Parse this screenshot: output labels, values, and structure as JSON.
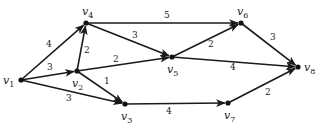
{
  "diagram": {
    "type": "weighted-directed-graph",
    "nodes": [
      {
        "id": "v1",
        "label": "v",
        "sub": "1",
        "x": 21,
        "y": 80,
        "lx": 3,
        "ly": 84
      },
      {
        "id": "v2",
        "label": "v",
        "sub": "2",
        "x": 77,
        "y": 71,
        "lx": 72,
        "ly": 87
      },
      {
        "id": "v3",
        "label": "v",
        "sub": "3",
        "x": 125,
        "y": 104,
        "lx": 121,
        "ly": 120
      },
      {
        "id": "v4",
        "label": "v",
        "sub": "4",
        "x": 86,
        "y": 23,
        "lx": 82,
        "ly": 15
      },
      {
        "id": "v5",
        "label": "v",
        "sub": "5",
        "x": 172,
        "y": 57,
        "lx": 167,
        "ly": 73
      },
      {
        "id": "v6",
        "label": "v",
        "sub": "6",
        "x": 241,
        "y": 23,
        "lx": 237,
        "ly": 15
      },
      {
        "id": "v7",
        "label": "v",
        "sub": "7",
        "x": 228,
        "y": 103,
        "lx": 224,
        "ly": 119
      },
      {
        "id": "v8",
        "label": "v",
        "sub": "8",
        "x": 298,
        "y": 67,
        "lx": 304,
        "ly": 71
      }
    ],
    "edges": [
      {
        "from": "v1",
        "to": "v4",
        "weight": "4",
        "lx": 46,
        "ly": 47
      },
      {
        "from": "v1",
        "to": "v2",
        "weight": "3",
        "lx": 47,
        "ly": 70
      },
      {
        "from": "v1",
        "to": "v3",
        "weight": "3",
        "lx": 66,
        "ly": 101
      },
      {
        "from": "v2",
        "to": "v4",
        "weight": "2",
        "lx": 84,
        "ly": 53
      },
      {
        "from": "v2",
        "to": "v5",
        "weight": "2",
        "lx": 113,
        "ly": 62
      },
      {
        "from": "v2",
        "to": "v3",
        "weight": "1",
        "lx": 104,
        "ly": 84
      },
      {
        "from": "v4",
        "to": "v6",
        "weight": "5",
        "lx": 164,
        "ly": 18
      },
      {
        "from": "v4",
        "to": "v5",
        "weight": "3",
        "lx": 132,
        "ly": 38
      },
      {
        "from": "v5",
        "to": "v6",
        "weight": "2",
        "lx": 208,
        "ly": 47
      },
      {
        "from": "v5",
        "to": "v8",
        "weight": "4",
        "lx": 230,
        "ly": 70
      },
      {
        "from": "v6",
        "to": "v8",
        "weight": "3",
        "lx": 270,
        "ly": 40
      },
      {
        "from": "v3",
        "to": "v7",
        "weight": "4",
        "lx": 166,
        "ly": 114
      },
      {
        "from": "v7",
        "to": "v8",
        "weight": "2",
        "lx": 265,
        "ly": 95
      }
    ]
  }
}
